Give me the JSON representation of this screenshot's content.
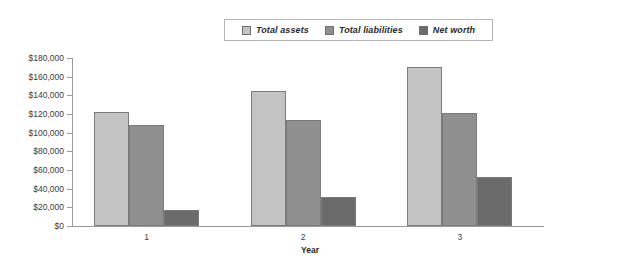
{
  "chart_data": {
    "type": "bar",
    "title": "",
    "subtitle": "",
    "xlabel": "Year",
    "ylabel": "",
    "categories": [
      "1",
      "2",
      "3"
    ],
    "series": [
      {
        "name": "Total assets",
        "color": "#c3c3c3",
        "values": [
          122000,
          145000,
          170000
        ]
      },
      {
        "name": "Total liabilities",
        "color": "#8f8f8f",
        "values": [
          108000,
          114000,
          121000
        ]
      },
      {
        "name": "Net worth",
        "color": "#6b6b6b",
        "values": [
          17000,
          31000,
          53000
        ]
      }
    ],
    "ylim": [
      0,
      180000
    ],
    "ytick_step": 20000,
    "ytick_labels": [
      "$0",
      "$20,000",
      "$40,000",
      "$60,000",
      "$80,000",
      "$100,000",
      "$120,000",
      "$140,000",
      "$160,000",
      "$180,000"
    ],
    "ytick_values": [
      0,
      20000,
      40000,
      60000,
      80000,
      100000,
      120000,
      140000,
      160000,
      180000
    ],
    "grid": false,
    "legend_position": "top-center",
    "axis_color": "#9a9a9a",
    "bar_border_color": "#7a7a7a"
  },
  "legend": {
    "entries": [
      {
        "label": "Total assets"
      },
      {
        "label": "Total liabilities"
      },
      {
        "label": "Net worth"
      }
    ]
  },
  "axes": {
    "x_title": "Year"
  }
}
